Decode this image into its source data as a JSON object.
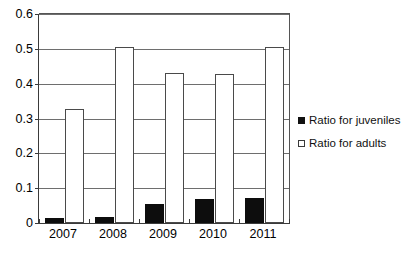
{
  "chart_data": {
    "type": "bar",
    "title": "",
    "subtitle": "",
    "xlabel": "",
    "ylabel": "",
    "categories": [
      "2007",
      "2008",
      "2009",
      "2010",
      "2011"
    ],
    "series": [
      {
        "name": "Ratio for juveniles",
        "marker": "filled-square",
        "color": "#0d0d0d",
        "values": [
          0.015,
          0.016,
          0.055,
          0.068,
          0.072
        ]
      },
      {
        "name": "Ratio for adults",
        "marker": "hollow-square",
        "color": "#ffffff",
        "values": [
          0.327,
          0.505,
          0.432,
          0.428,
          0.505
        ]
      }
    ],
    "ylim": [
      0,
      0.6
    ],
    "yticks": [
      "0",
      "0.1",
      "0.2",
      "0.3",
      "0.4",
      "0.5",
      "0.6"
    ],
    "ytick_values": [
      0,
      0.1,
      0.2,
      0.3,
      0.4,
      0.5,
      0.6
    ],
    "grid": "horizontal",
    "legend_position": "right"
  },
  "legend": {
    "entries": [
      {
        "label": "Ratio for juveniles"
      },
      {
        "label": "Ratio for adults"
      }
    ]
  },
  "axes": {
    "y_tick_labels": [
      "0.6",
      "0.5",
      "0.4",
      "0.3",
      "0.2",
      "0.1",
      "0"
    ],
    "x_tick_labels": [
      "2007",
      "2008",
      "2009",
      "2010",
      "2011"
    ]
  }
}
